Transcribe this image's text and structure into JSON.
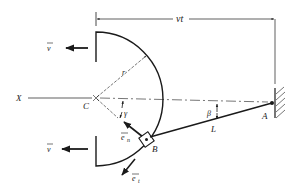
{
  "figure": {
    "colors": {
      "ink": "#1a1a1a",
      "background": "#ffffff"
    }
  },
  "labels": {
    "velocity_top": "v",
    "velocity_bottom": "v",
    "displacement": "vt",
    "radius": "r",
    "axis": "X",
    "center": "C",
    "angle_gamma": "γ",
    "angle_beta": "β",
    "rod_length": "L",
    "unit_normal": "e",
    "unit_normal_sub": "n",
    "unit_tangent": "e",
    "unit_tangent_sub": "t",
    "slider": "B",
    "pivot": "A"
  },
  "icons": {
    "wall": "hatched-wall-icon",
    "pivot": "pin-joint-icon",
    "slider": "slider-block-icon"
  }
}
